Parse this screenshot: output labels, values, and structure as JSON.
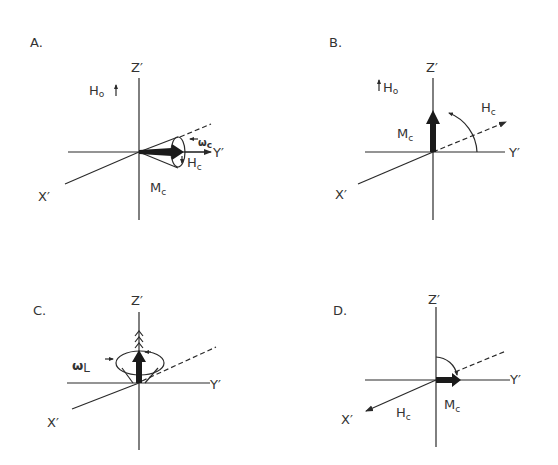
{
  "figure": {
    "background": "#ffffff",
    "ink": "#2a2a2a",
    "panels": [
      {
        "id": "A",
        "label": "A.",
        "axes": {
          "z": "Z′",
          "y": "Y′",
          "x": "X′"
        },
        "field_label": {
          "main": "H",
          "sub": "o"
        },
        "vectors": [
          {
            "name": "magnetization",
            "main": "M",
            "sub": "c"
          },
          {
            "name": "effective-field",
            "main": "H",
            "sub": "c"
          }
        ],
        "precession": {
          "main": "ω",
          "sub": "c"
        }
      },
      {
        "id": "B",
        "label": "B.",
        "axes": {
          "z": "Z′",
          "y": "Y′",
          "x": "X′"
        },
        "field_label": {
          "main": "H",
          "sub": "o"
        },
        "vectors": [
          {
            "name": "magnetization",
            "main": "M",
            "sub": "c"
          },
          {
            "name": "effective-field",
            "main": "H",
            "sub": "c"
          }
        ]
      },
      {
        "id": "C",
        "label": "C.",
        "axes": {
          "z": "Z′",
          "y": "Y′",
          "x": "X′"
        },
        "precession": {
          "main": "ω",
          "sub": "L"
        }
      },
      {
        "id": "D",
        "label": "D.",
        "axes": {
          "z": "Z′",
          "y": "Y′",
          "x": "X′"
        },
        "vectors": [
          {
            "name": "magnetization",
            "main": "M",
            "sub": "c"
          },
          {
            "name": "effective-field",
            "main": "H",
            "sub": "c"
          }
        ]
      }
    ]
  }
}
